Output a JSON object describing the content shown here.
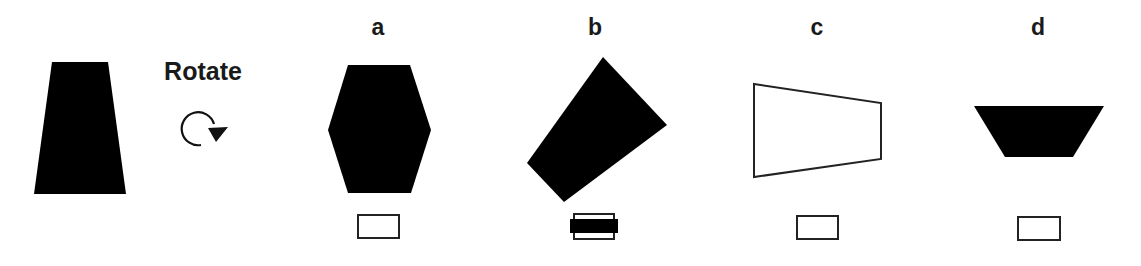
{
  "instruction": {
    "label": "Rotate",
    "icon": "rotate-clockwise-icon"
  },
  "source_shape": {
    "name": "trapezoid",
    "fill": "#000000",
    "points": "52,62 108,62 126,194 34,194"
  },
  "options": [
    {
      "label": "a",
      "fill": "#000000",
      "stroke": "none",
      "points": "348,65 410,65 431,130 411,193 348,193 328,130",
      "checked": false,
      "label_x": 378
    },
    {
      "label": "b",
      "fill": "#000000",
      "stroke": "none",
      "points": "603,57 667,125 564,202 527,163",
      "checked": true,
      "label_x": 595
    },
    {
      "label": "c",
      "fill": "#ffffff",
      "stroke": "#222222",
      "points": "754,84 881,103 881,159 754,177",
      "checked": false,
      "label_x": 817
    },
    {
      "label": "d",
      "fill": "#000000",
      "stroke": "none",
      "points": "974,106 1104,106 1073,157 1005,157",
      "checked": false,
      "label_x": 1038
    }
  ],
  "colors": {
    "ink": "#000000",
    "text": "#1a1a1a",
    "background": "#ffffff"
  }
}
